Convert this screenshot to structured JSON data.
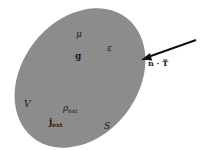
{
  "diagram": {
    "type": "volume-region-with-surface",
    "region": {
      "shape": "ellipse",
      "fill_color": "#8a8a8a",
      "volume_label": "V",
      "surface_label": "S"
    },
    "labels": {
      "mu": "μ",
      "epsilon": "ε",
      "g": "g",
      "rho_ext": "ρ",
      "rho_ext_sub": "ext",
      "j_ext": "j",
      "j_ext_sub": "ext",
      "volume": "V",
      "surface": "S"
    },
    "arrow": {
      "label": "n̂ · T̿",
      "color": "#111111",
      "direction": "inward"
    }
  }
}
